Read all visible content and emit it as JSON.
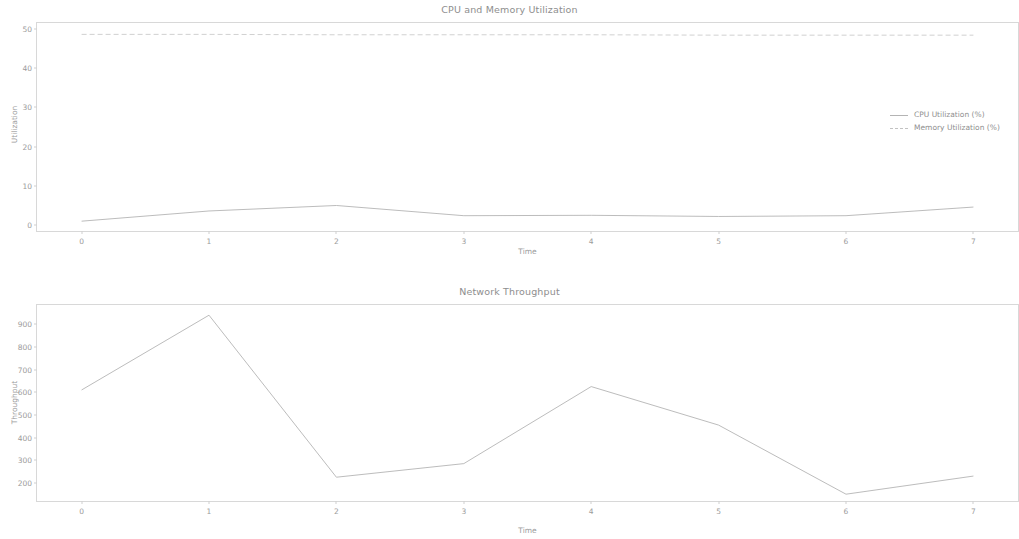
{
  "figure": {
    "background_color": "#ffffff",
    "line_color": "#b4b4b4",
    "text_color": "#9b9b9b",
    "axis_color": "#d8d8d8"
  },
  "charts": [
    {
      "title": "CPU and Memory Utilization",
      "xlabel": "Time",
      "ylabel": "Utilization",
      "xticks": [
        "0",
        "1",
        "2",
        "3",
        "4",
        "5",
        "6",
        "7"
      ],
      "yticks": [
        "0",
        "10",
        "20",
        "30",
        "40",
        "50"
      ],
      "legend": [
        {
          "label": "CPU Utilization (%)",
          "style": "solid"
        },
        {
          "label": "Memory Utilization (%)",
          "style": "dashed"
        }
      ]
    },
    {
      "title": "Network Throughput",
      "xlabel": "Time",
      "ylabel": "Throughput",
      "xticks": [
        "0",
        "1",
        "2",
        "3",
        "4",
        "5",
        "6",
        "7"
      ],
      "yticks": [
        "200",
        "300",
        "400",
        "500",
        "600",
        "700",
        "800",
        "900"
      ],
      "legend": [
        {
          "label": "Network Throughput (Mbps)",
          "style": "solid"
        }
      ]
    }
  ],
  "chart_data": [
    {
      "type": "line",
      "title": "CPU and Memory Utilization",
      "xlabel": "Time",
      "ylabel": "Utilization",
      "x": [
        0,
        1,
        2,
        3,
        4,
        5,
        6,
        7
      ],
      "xlim": [
        -0.35,
        7.35
      ],
      "ylim": [
        -1.5,
        51.5
      ],
      "grid": false,
      "legend_position": "center right",
      "series": [
        {
          "name": "CPU Utilization (%)",
          "style": "solid",
          "values": [
            1.0,
            3.6,
            5.0,
            2.4,
            2.5,
            2.2,
            2.4,
            4.6
          ]
        },
        {
          "name": "Memory Utilization (%)",
          "style": "dashed",
          "values": [
            48.6,
            48.6,
            48.5,
            48.5,
            48.5,
            48.4,
            48.4,
            48.4
          ]
        }
      ]
    },
    {
      "type": "line",
      "title": "Network Throughput",
      "xlabel": "Time",
      "ylabel": "Throughput",
      "x": [
        0,
        1,
        2,
        3,
        4,
        5,
        6,
        7
      ],
      "xlim": [
        -0.35,
        7.35
      ],
      "ylim": [
        120,
        985
      ],
      "grid": false,
      "legend_position": "upper right",
      "series": [
        {
          "name": "Network Throughput (Mbps)",
          "style": "solid",
          "values": [
            610,
            940,
            225,
            285,
            625,
            455,
            150,
            230
          ]
        }
      ]
    }
  ]
}
